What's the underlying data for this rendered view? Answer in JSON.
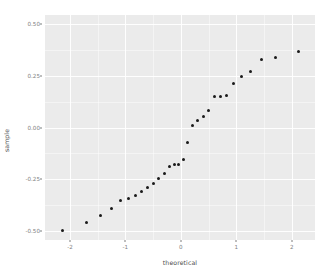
{
  "chart_data": {
    "type": "scatter",
    "title": "",
    "subtitle": "",
    "xlabel": "theoretical",
    "ylabel": "sample",
    "xlim": [
      -2.45,
      2.42
    ],
    "ylim": [
      -0.545,
      0.545
    ],
    "xticks": [
      -2,
      -1,
      0,
      1,
      2
    ],
    "xticklabels": [
      "-2",
      "-1",
      "0",
      "1",
      "2"
    ],
    "yticks": [
      -0.5,
      -0.25,
      0,
      0.25,
      0.5
    ],
    "yticklabels": [
      "-0.50",
      "-0.25",
      "0.00",
      "0.25",
      "0.50"
    ],
    "x_minor_ticks": [
      -1.5,
      -0.5,
      0.5,
      1.5
    ],
    "y_minor_ticks": [
      -0.375,
      -0.125,
      0.125,
      0.375
    ],
    "grid": true,
    "legend": "none",
    "panel_background": "#ebebeb",
    "grid_color": "#ffffff",
    "point_color": "#1a1a1a",
    "point_size": 3,
    "n_points": 30,
    "series": [
      {
        "name": "sample quantiles",
        "x": [
          -2.13,
          -1.71,
          -1.45,
          -1.25,
          -1.09,
          -0.95,
          -0.82,
          -0.71,
          -0.6,
          -0.5,
          -0.4,
          -0.3,
          -0.21,
          -0.12,
          -0.04,
          0.04,
          0.12,
          0.21,
          0.3,
          0.4,
          0.5,
          0.6,
          0.71,
          0.82,
          0.95,
          1.09,
          1.25,
          1.45,
          1.71,
          2.13
        ],
        "y": [
          -0.5,
          -0.46,
          -0.425,
          -0.39,
          -0.355,
          -0.345,
          -0.33,
          -0.31,
          -0.29,
          -0.27,
          -0.245,
          -0.225,
          -0.19,
          -0.18,
          -0.178,
          -0.155,
          -0.075,
          0.01,
          0.035,
          0.055,
          0.08,
          0.15,
          0.152,
          0.155,
          0.215,
          0.245,
          0.27,
          0.33,
          0.34,
          0.37
        ],
        "y_display": [
          -0.5,
          -0.46,
          -0.425,
          -0.39,
          -0.355,
          -0.345,
          -0.33,
          -0.31,
          -0.29,
          -0.27,
          -0.245,
          -0.225,
          -0.19,
          -0.18,
          -0.178,
          -0.155,
          -0.075,
          0.01,
          0.035,
          0.055,
          0.08,
          0.15,
          0.152,
          0.155,
          0.215,
          0.245,
          0.27,
          0.33,
          0.34,
          0.37
        ]
      }
    ]
  }
}
